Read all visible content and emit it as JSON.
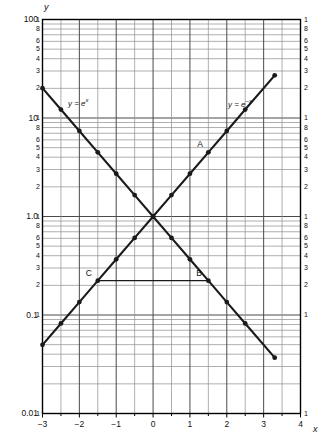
{
  "chart_data": {
    "type": "line",
    "title": "",
    "xlabel": "x",
    "ylabel": "y",
    "yscale": "log",
    "xscale": "linear",
    "xlim": [
      -3,
      4
    ],
    "ylim": [
      0.01,
      100
    ],
    "grid": true,
    "legend_position": "inline-annotations",
    "x_ticks": [
      -3,
      -2,
      -1,
      0,
      1,
      2,
      3,
      4
    ],
    "x_tick_labels": [
      "−3",
      "−2",
      "−1",
      "0",
      "1",
      "2",
      "3",
      "4"
    ],
    "x_minor_step": 0.5,
    "y_decade_labels": [
      "100",
      "10",
      "1.0",
      "0.1",
      "0.01"
    ],
    "y_decade_values": [
      100,
      10,
      1.0,
      0.1,
      0.01
    ],
    "y_minor_labels": [
      "1",
      "8",
      "6",
      "5",
      "4",
      "3",
      "2"
    ],
    "y_minor_label_values": [
      1,
      8,
      6,
      5,
      4,
      3,
      2
    ],
    "series": [
      {
        "name": "y = e^x",
        "label_html": "y = e<sup>x</sup>",
        "x": [
          -3,
          -2.5,
          -2,
          -1.5,
          -1,
          -0.5,
          0,
          0.5,
          1,
          1.5,
          2,
          2.5,
          3.3
        ],
        "values": [
          0.0498,
          0.0821,
          0.1353,
          0.2231,
          0.3679,
          0.6065,
          1.0,
          1.6487,
          2.7183,
          4.4817,
          7.3891,
          12.182,
          27.113
        ],
        "markers": true
      },
      {
        "name": "y = e^-x",
        "label_html": "y = e<sup>−x</sup>",
        "x": [
          -3,
          -2.5,
          -2,
          -1.5,
          -1,
          -0.5,
          0,
          0.5,
          1,
          1.5,
          2,
          2.5,
          3.3
        ],
        "values": [
          20.086,
          12.182,
          7.3891,
          4.4817,
          2.7183,
          1.6487,
          1.0,
          0.6065,
          0.3679,
          0.2231,
          0.1353,
          0.0821,
          0.0369
        ],
        "markers": true
      }
    ],
    "annotations": [
      {
        "name": "A",
        "label": "A",
        "x": 1.5,
        "y": 4.4817,
        "series": "y = e^x"
      },
      {
        "name": "B",
        "label": "B",
        "x": 1.5,
        "y": 0.2231,
        "series": "y = e^-x"
      },
      {
        "name": "C",
        "label": "C",
        "x": -1.5,
        "y": 0.2231,
        "series": "y = e^x"
      }
    ],
    "connector_segments": [
      {
        "name": "C-to-B",
        "from": {
          "x": -1.5,
          "y": 0.2231
        },
        "to": {
          "x": 1.5,
          "y": 0.2231
        }
      }
    ],
    "colors": {
      "curve": "#1a1a1a",
      "grid_major": "#4a4a4a",
      "grid_minor": "#8d8d8d",
      "axis": "#000000",
      "background": "#ffffff"
    }
  }
}
